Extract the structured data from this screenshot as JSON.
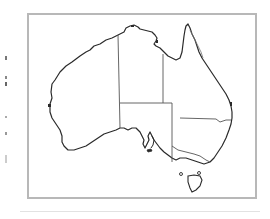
{
  "map": {
    "subject": "Australia outline map with state and territory borders",
    "regions": [
      "Western Australia",
      "Northern Territory",
      "South Australia",
      "Queensland",
      "New South Wales",
      "Victoria",
      "Tasmania"
    ],
    "colors": {
      "outline": "#2a2a2a",
      "border": "#555555",
      "frame": "#b8b8b8",
      "background": "#ffffff"
    }
  }
}
